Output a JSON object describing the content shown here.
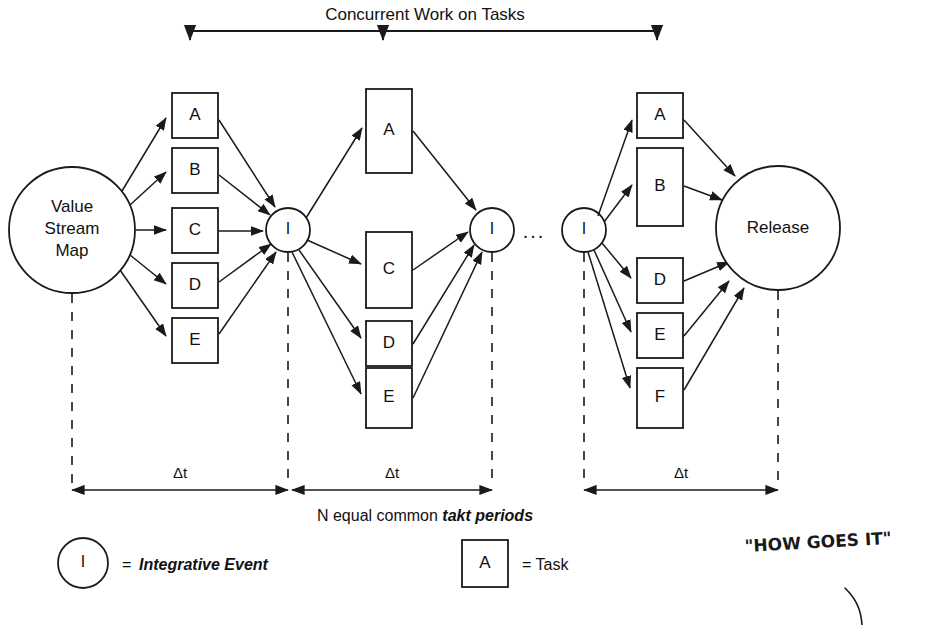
{
  "diagram": {
    "title": "Concurrent Work on Tasks",
    "caption": "N equal common ",
    "caption_emphasis": "takt periods",
    "start_node": {
      "label_line1": "Value",
      "label_line2": "Stream",
      "label_line3": "Map"
    },
    "end_node": {
      "label": "Release"
    },
    "event_label": "I",
    "ellipsis": "...",
    "interval_label": "Δt",
    "intervals": [
      "Δt",
      "Δt",
      "Δt"
    ],
    "columns": [
      {
        "name": "column-1",
        "tasks": [
          "A",
          "B",
          "C",
          "D",
          "E"
        ]
      },
      {
        "name": "column-2",
        "tasks": [
          "A",
          "C",
          "D",
          "E"
        ]
      },
      {
        "name": "column-3",
        "tasks": [
          "A",
          "B",
          "D",
          "E",
          "F"
        ]
      }
    ],
    "events": [
      "I",
      "I",
      "I"
    ],
    "legend": {
      "event_symbol": "I",
      "event_equals": "=",
      "event_label": "Integrative Event",
      "task_symbol": "A",
      "task_equals": "= Task"
    },
    "annotation": {
      "handwritten_note": "\"HOW GOES IT\""
    },
    "colors": {
      "ink": "#1a1a1a",
      "background": "#ffffff",
      "handwriting": "#1a1a1a"
    }
  }
}
